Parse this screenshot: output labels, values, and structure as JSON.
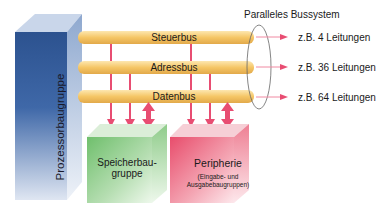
{
  "title": "Paralleles Bussystem",
  "processor": {
    "label": "Prozessorbaugruppe",
    "color": "#2f5597"
  },
  "buses": [
    {
      "name": "Steuerbus",
      "lines": "z.B. 4 Leitungen"
    },
    {
      "name": "Adressbus",
      "lines": "z.B. 36 Leitungen"
    },
    {
      "name": "Datenbus",
      "lines": "z.B. 64 Leitungen"
    }
  ],
  "memory": {
    "label_line1": "Speicherbau-",
    "label_line2": "gruppe",
    "color": "#7cc47a"
  },
  "peripherals": {
    "label": "Peripherie",
    "sub_line1": "(Eingabe- und",
    "sub_line2": "Ausgabebaugruppen)",
    "color": "#e8556f"
  },
  "colors": {
    "bus": "#f3c76a",
    "arrow": "#e84d72",
    "ellipse": "#666666"
  }
}
